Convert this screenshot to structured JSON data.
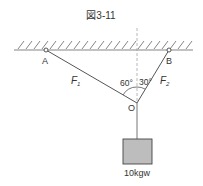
{
  "figure": {
    "title": "図3-11",
    "points": {
      "A": "A",
      "B": "B",
      "O": "O"
    },
    "forces": {
      "f1": "F",
      "f1_sub": "1",
      "f2": "F",
      "f2_sub": "2"
    },
    "angles": {
      "left": "60°",
      "right": "30°"
    },
    "weight_label": "10kgw",
    "colors": {
      "line": "#555555",
      "box_fill": "#bdbdbd",
      "box_stroke": "#444444"
    }
  }
}
